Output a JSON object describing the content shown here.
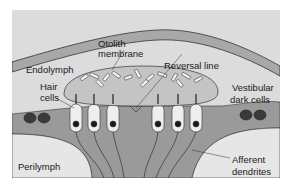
{
  "diagram": {
    "type": "anatomical-illustration",
    "labels": {
      "endolymph": "Endolymph",
      "otolith_membrane_line1": "Otolith",
      "otolith_membrane_line2": "membrane",
      "reversal_line": "Reversal line",
      "hair_cells_line1": "Hair",
      "hair_cells_line2": "cells",
      "vestibular_dark_cells_line1": "Vestibular",
      "vestibular_dark_cells_line2": "dark cells",
      "perilymph": "Perilymph",
      "afferent_dendrites_line1": "Afferent",
      "afferent_dendrites_line2": "dendrites"
    },
    "hair_cell_count": 6,
    "colors": {
      "background": "#dcdcdc",
      "membrane_band": "#a8a8a8",
      "tissue": "#9a9a9a",
      "perilymph": "#e6e6e6",
      "otolith_membrane": "#c4c4c4",
      "hair_cell": "#eeeeee",
      "nucleus": "#1a1a1a",
      "dark_cell": "#3a3a3a",
      "outline": "#333333"
    }
  }
}
